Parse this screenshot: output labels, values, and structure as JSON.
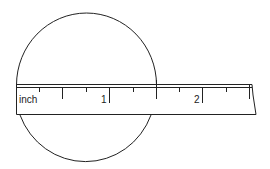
{
  "diagram": {
    "ruler": {
      "unit_label": "inch",
      "major_labels": [
        "1",
        "2"
      ]
    },
    "colors": {
      "stroke": "#222222",
      "background": "#ffffff"
    }
  }
}
